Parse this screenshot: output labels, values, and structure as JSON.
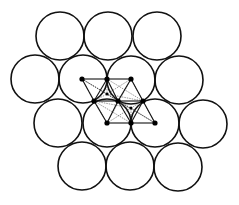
{
  "diagram": {
    "stroke_color": "#111111",
    "background": "#ffffff",
    "circle_radius": 24,
    "circles": [
      {
        "row": 1,
        "cx": 60,
        "cy": 36
      },
      {
        "row": 1,
        "cx": 108,
        "cy": 36
      },
      {
        "row": 1,
        "cx": 157,
        "cy": 36
      },
      {
        "row": 2,
        "cx": 35,
        "cy": 79
      },
      {
        "row": 2,
        "cx": 83,
        "cy": 79
      },
      {
        "row": 2,
        "cx": 131,
        "cy": 80
      },
      {
        "row": 2,
        "cx": 179,
        "cy": 80
      },
      {
        "row": 3,
        "cx": 58,
        "cy": 123
      },
      {
        "row": 3,
        "cx": 107,
        "cy": 123
      },
      {
        "row": 3,
        "cx": 155,
        "cy": 123
      },
      {
        "row": 3,
        "cx": 203,
        "cy": 124
      },
      {
        "row": 4,
        "cx": 82,
        "cy": 166
      },
      {
        "row": 4,
        "cx": 130,
        "cy": 166
      },
      {
        "row": 4,
        "cx": 178,
        "cy": 167
      }
    ],
    "lattice_nodes": [
      {
        "id": "a",
        "x": 82,
        "y": 79
      },
      {
        "id": "b",
        "x": 107,
        "y": 79
      },
      {
        "id": "c",
        "x": 131,
        "y": 79
      },
      {
        "id": "d",
        "x": 94,
        "y": 101
      },
      {
        "id": "e",
        "x": 118,
        "y": 101
      },
      {
        "id": "f",
        "x": 143,
        "y": 101
      },
      {
        "id": "g",
        "x": 107,
        "y": 123
      },
      {
        "id": "h",
        "x": 131,
        "y": 123
      },
      {
        "id": "i",
        "x": 155,
        "y": 123
      }
    ],
    "interstitial_nodes": [
      {
        "id": "t1",
        "x": 107,
        "y": 94
      },
      {
        "id": "t2",
        "x": 131,
        "y": 108
      }
    ],
    "main_edges": [
      [
        "a",
        "b"
      ],
      [
        "b",
        "c"
      ],
      [
        "d",
        "e"
      ],
      [
        "e",
        "f"
      ],
      [
        "g",
        "h"
      ],
      [
        "h",
        "i"
      ],
      [
        "a",
        "d"
      ],
      [
        "d",
        "g"
      ],
      [
        "b",
        "e"
      ],
      [
        "e",
        "h"
      ],
      [
        "c",
        "f"
      ],
      [
        "f",
        "i"
      ],
      [
        "b",
        "d"
      ],
      [
        "c",
        "e"
      ],
      [
        "e",
        "g"
      ],
      [
        "f",
        "h"
      ]
    ],
    "inner_edges": [
      [
        "a",
        "t1"
      ],
      [
        "b",
        "t1"
      ],
      [
        "c",
        "t1"
      ],
      [
        "d",
        "t1"
      ],
      [
        "e",
        "t1"
      ],
      [
        "f",
        "t1"
      ],
      [
        "d",
        "t2"
      ],
      [
        "e",
        "t2"
      ],
      [
        "f",
        "t2"
      ],
      [
        "g",
        "t2"
      ],
      [
        "h",
        "t2"
      ],
      [
        "i",
        "t2"
      ],
      [
        "a",
        "e"
      ],
      [
        "b",
        "f"
      ],
      [
        "d",
        "h"
      ],
      [
        "e",
        "i"
      ],
      [
        "a",
        "g"
      ],
      [
        "c",
        "g"
      ],
      [
        "c",
        "i"
      ],
      [
        "a",
        "i"
      ]
    ]
  }
}
